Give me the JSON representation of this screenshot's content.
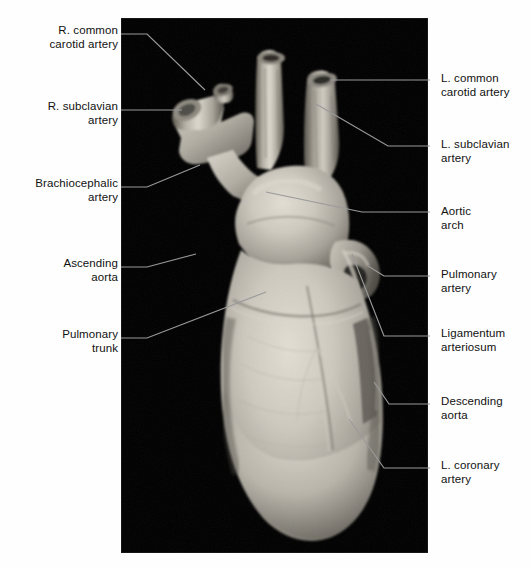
{
  "figure": {
    "kind": "anatomical-photograph",
    "plate": {
      "background_color": "#000000",
      "x": 121,
      "y": 18,
      "width": 307,
      "height": 535
    },
    "specimen_color_light": "#d8d4cb",
    "specimen_color_mid": "#a8a49b",
    "specimen_color_dark": "#6a665e",
    "leader_color": "#9a9a9a",
    "text_color": "#111111"
  },
  "labels": {
    "left": [
      {
        "id": "r-common-carotid-artery",
        "line1": "R. common",
        "line2": "carotid artery",
        "text": "R. common\ncarotid artery",
        "text_x": 10,
        "text_y": 24,
        "text_w": 108,
        "leader": "M121,34 L147,34 L205,90"
      },
      {
        "id": "r-subclavian-artery",
        "line1": "R. subclavian",
        "line2": "artery",
        "text": "R. subclavian\nartery",
        "text_x": 10,
        "text_y": 100,
        "text_w": 108,
        "leader": "M121,110 L182,110"
      },
      {
        "id": "brachiocephalic-artery",
        "line1": "Brachiocephalic",
        "line2": "artery",
        "text": "Brachiocephalic\nartery",
        "text_x": 6,
        "text_y": 177,
        "text_w": 112,
        "leader": "M121,187 L147,187 L200,165"
      },
      {
        "id": "ascending-aorta",
        "line1": "Ascending",
        "line2": "aorta",
        "text": "Ascending\naorta",
        "text_x": 10,
        "text_y": 257,
        "text_w": 108,
        "leader": "M121,267 L147,267 L196,254"
      },
      {
        "id": "pulmonary-trunk",
        "line1": "Pulmonary",
        "line2": "trunk",
        "text": "Pulmonary\ntrunk",
        "text_x": 10,
        "text_y": 328,
        "text_w": 108,
        "leader": "M121,338 L147,338 L266,292"
      }
    ],
    "right": [
      {
        "id": "l-common-carotid-artery",
        "line1": "L. common",
        "line2": "carotid artery",
        "text": "L. common\ncarotid artery",
        "text_x": 441,
        "text_y": 72,
        "text_w": 120,
        "leader": "M330,80 L430,80"
      },
      {
        "id": "l-subclavian-artery",
        "line1": "L. subclavian",
        "line2": "artery",
        "text": "L. subclavian\nartery",
        "text_x": 441,
        "text_y": 138,
        "text_w": 120,
        "leader": "M316,104 L388,146 L430,146"
      },
      {
        "id": "aortic-arch",
        "line1": "Aortic",
        "line2": "arch",
        "text": "Aortic\narch",
        "text_x": 441,
        "text_y": 205,
        "text_w": 120,
        "leader": "M266,192 L362,212 L430,212"
      },
      {
        "id": "pulmonary-artery",
        "line1": "Pulmonary",
        "line2": "artery",
        "text": "Pulmonary\nartery",
        "text_x": 441,
        "text_y": 268,
        "text_w": 120,
        "leader": "M368,266 L384,276 L430,276"
      },
      {
        "id": "ligamentum-arteriosum",
        "line1": "Ligamentum",
        "line2": "arteriosum",
        "text": "Ligamentum\narteriosum",
        "text_x": 441,
        "text_y": 327,
        "text_w": 120,
        "leader": "M352,254 L384,336 L430,336"
      },
      {
        "id": "descending-aorta",
        "line1": "Descending",
        "line2": "aorta",
        "text": "Descending\naorta",
        "text_x": 441,
        "text_y": 395,
        "text_w": 120,
        "leader": "M374,382 L389,404 L430,404"
      },
      {
        "id": "l-coronary-artery",
        "line1": "L. coronary",
        "line2": "artery",
        "text": "L. coronary\nartery",
        "text_x": 441,
        "text_y": 459,
        "text_w": 120,
        "leader": "M349,419 L384,468 L430,468"
      }
    ]
  }
}
